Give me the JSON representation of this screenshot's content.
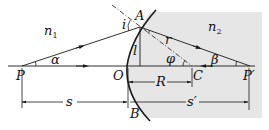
{
  "diagram": {
    "type": "refraction-at-spherical-surface",
    "colors": {
      "line": "#1a1a1a",
      "shaded_medium": "#e6e6e6",
      "background": "#ffffff"
    },
    "media": [
      {
        "id": "n1",
        "label": "n",
        "subscript": "1"
      },
      {
        "id": "n2",
        "label": "n",
        "subscript": "2"
      }
    ],
    "points": {
      "P": "P",
      "O": "O",
      "C": "C",
      "P_prime": "P′",
      "A": "A",
      "B": "B"
    },
    "angles": {
      "alpha": "α",
      "beta": "β",
      "phi": "φ",
      "i": "i",
      "r": "r"
    },
    "lengths": {
      "height": "l",
      "radius": "R",
      "object_distance": "s",
      "image_distance": "s′"
    }
  }
}
